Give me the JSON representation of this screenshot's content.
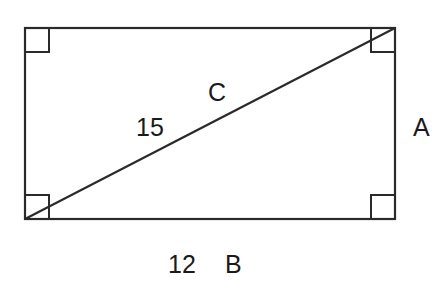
{
  "diagram": {
    "type": "rectangle-with-diagonal",
    "labels": {
      "diagonal_letter": "C",
      "diagonal_length": "15",
      "side_right_letter": "A",
      "side_bottom_length": "12",
      "side_bottom_letter": "B"
    },
    "right_angle_markers": [
      "top-left",
      "top-right",
      "bottom-left",
      "bottom-right"
    ],
    "stroke_color": "#2a2a2a"
  }
}
